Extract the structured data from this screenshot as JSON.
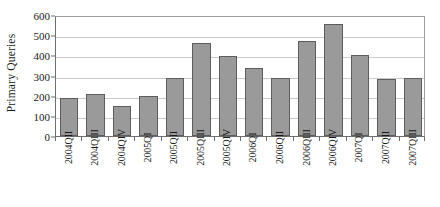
{
  "chart_data": {
    "type": "bar",
    "title": "",
    "subtitle": "",
    "xlabel": "",
    "ylabel": "Primary Queries",
    "ylim": [
      0,
      600
    ],
    "ytick_step": 100,
    "yticks": [
      0,
      100,
      200,
      300,
      400,
      500,
      600
    ],
    "ytick_labels": [
      "0",
      "100",
      "200",
      "300",
      "400",
      "500",
      "600"
    ],
    "grid": true,
    "legend": false,
    "legend_position": "none",
    "bar_color": "#9a9a9a",
    "bar_edge_color": "#5d5d5d",
    "gridline_color": "#c9c9c9",
    "axis_color": "#6e6e6e",
    "categories": [
      "2004QII",
      "2004QIII",
      "2004QIV",
      "2005QI",
      "2005QII",
      "2005QIII",
      "2005QIV",
      "2006QI",
      "2006QII",
      "2006QIII",
      "2006QIV",
      "2007QI",
      "2007QII",
      "2007QIII"
    ],
    "values": [
      190,
      210,
      150,
      200,
      290,
      460,
      395,
      335,
      290,
      470,
      555,
      400,
      285,
      290
    ]
  }
}
